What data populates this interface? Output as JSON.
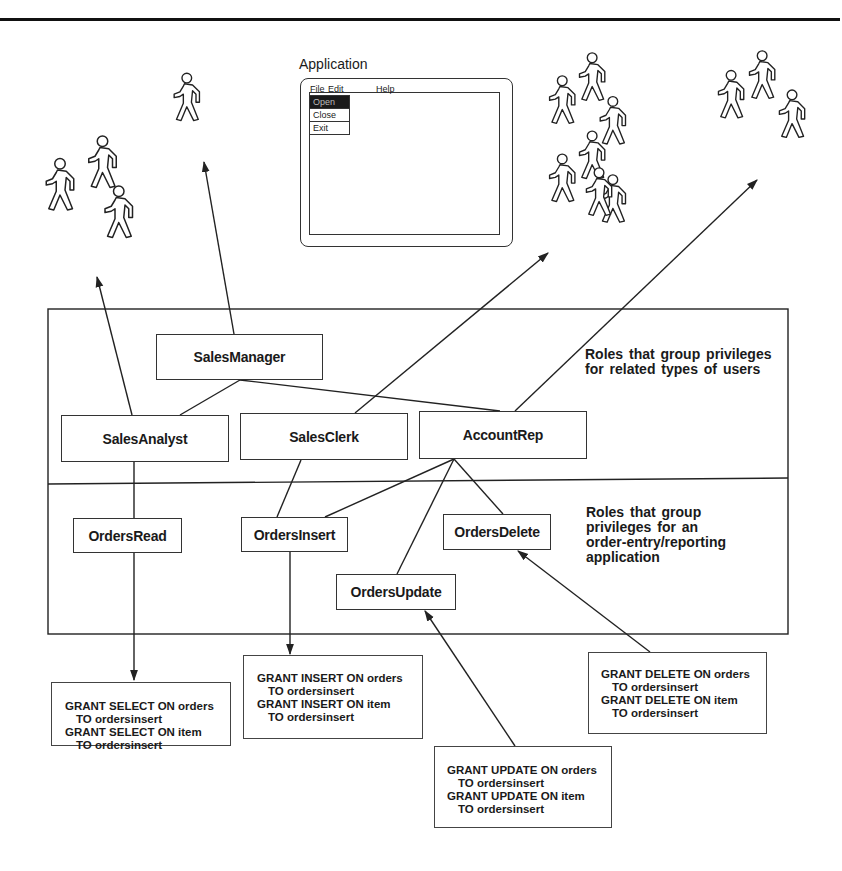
{
  "application": {
    "title": "Application",
    "menubar": [
      "File",
      "Edit",
      "Help"
    ],
    "file_menu": [
      "Open",
      "Close",
      "Exit"
    ],
    "selected_item": "Open"
  },
  "user_groups": [
    {
      "name": "analysts-group",
      "count": 3
    },
    {
      "name": "manager",
      "count": 1
    },
    {
      "name": "clerks-group",
      "count": 7
    },
    {
      "name": "account-reps-group",
      "count": 3
    }
  ],
  "user_roles": {
    "note": [
      "Roles that group privileges",
      "for related types of users"
    ],
    "roles": [
      "SalesManager",
      "SalesAnalyst",
      "SalesClerk",
      "AccountRep"
    ]
  },
  "app_roles": {
    "note": [
      "Roles that group",
      "privileges for an",
      "order-entry/reporting",
      "application"
    ],
    "roles": [
      "OrdersRead",
      "OrdersInsert",
      "OrdersDelete",
      "OrdersUpdate"
    ]
  },
  "grants": {
    "select": [
      "GRANT SELECT ON orders",
      "TO ordersinsert",
      "GRANT SELECT ON item",
      "TO ordersinsert"
    ],
    "insert": [
      "GRANT INSERT ON orders",
      "TO ordersinsert",
      "GRANT INSERT ON item",
      "TO ordersinsert"
    ],
    "update": [
      "GRANT UPDATE ON orders",
      "TO ordersinsert",
      "GRANT UPDATE ON item",
      "TO ordersinsert"
    ],
    "delete": [
      "GRANT DELETE ON orders",
      "TO ordersinsert",
      "GRANT DELETE ON item",
      "TO ordersinsert"
    ]
  },
  "colors": {
    "line": "#222222",
    "background": "#ffffff",
    "menu_selected": "#1a1a1a"
  }
}
